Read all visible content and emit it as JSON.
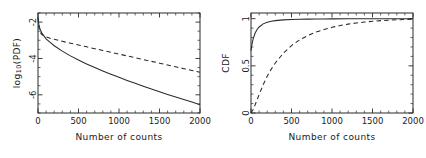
{
  "figure": {
    "panel_count": 2,
    "background_color": "#ffffff",
    "line_color": "#2b2b2b"
  },
  "chart_data": [
    {
      "type": "line",
      "panel": "left",
      "title": "",
      "xlabel": "Number of counts",
      "ylabel": "log10(PDF)",
      "ylabel_display": "log₁₀(PDF)",
      "xlim": [
        0,
        2000
      ],
      "ylim": [
        -7.0,
        -1.5
      ],
      "xticks": [
        0,
        500,
        1000,
        1500,
        2000
      ],
      "xtick_labels": [
        "0",
        "500",
        "1000",
        "1500",
        "2000"
      ],
      "yticks": [
        -2,
        -4,
        -6
      ],
      "ytick_labels": [
        "-2",
        "-4",
        "-6"
      ],
      "minor_ticks": true,
      "grid": false,
      "legend": "none",
      "series": [
        {
          "name": "solid",
          "style": "solid",
          "x": [
            0,
            10,
            25,
            50,
            100,
            150,
            200,
            300,
            400,
            500,
            600,
            700,
            800,
            900,
            1000,
            1100,
            1200,
            1300,
            1400,
            1500,
            1600,
            1700,
            1800,
            1900,
            2000
          ],
          "y": [
            -1.75,
            -2.12,
            -2.38,
            -2.62,
            -2.92,
            -3.12,
            -3.3,
            -3.6,
            -3.86,
            -4.09,
            -4.3,
            -4.5,
            -4.69,
            -4.87,
            -5.04,
            -5.21,
            -5.37,
            -5.53,
            -5.68,
            -5.83,
            -5.98,
            -6.12,
            -6.26,
            -6.4,
            -6.54
          ]
        },
        {
          "name": "dashed",
          "style": "dashed",
          "x": [
            0,
            10,
            25,
            50,
            100,
            150,
            200,
            300,
            400,
            500,
            600,
            700,
            800,
            900,
            1000,
            1100,
            1200,
            1300,
            1400,
            1500,
            1600,
            1700,
            1800,
            1900,
            2000
          ],
          "y": [
            -1.75,
            -2.3,
            -2.55,
            -2.7,
            -2.82,
            -2.89,
            -2.95,
            -3.06,
            -3.16,
            -3.26,
            -3.36,
            -3.46,
            -3.56,
            -3.66,
            -3.76,
            -3.86,
            -3.96,
            -4.06,
            -4.16,
            -4.26,
            -4.36,
            -4.46,
            -4.56,
            -4.66,
            -4.76
          ]
        }
      ]
    },
    {
      "type": "line",
      "panel": "right",
      "title": "",
      "xlabel": "Number of counts",
      "ylabel": "CDF",
      "xlim": [
        0,
        2000
      ],
      "ylim": [
        0.0,
        1.06
      ],
      "xticks": [
        0,
        500,
        1000,
        1500,
        2000
      ],
      "xtick_labels": [
        "0",
        "500",
        "1000",
        "1500",
        "2000"
      ],
      "yticks": [
        0,
        0.5,
        1
      ],
      "ytick_labels": [
        "0",
        "0.5",
        "1"
      ],
      "minor_ticks": true,
      "grid": false,
      "legend": "none",
      "series": [
        {
          "name": "solid",
          "style": "solid",
          "x": [
            0,
            10,
            25,
            50,
            75,
            100,
            150,
            200,
            250,
            300,
            400,
            500,
            600,
            700,
            800,
            900,
            1000,
            1200,
            1400,
            1600,
            1800,
            2000
          ],
          "y": [
            0.66,
            0.72,
            0.78,
            0.845,
            0.885,
            0.912,
            0.945,
            0.962,
            0.972,
            0.979,
            0.987,
            0.991,
            0.9935,
            0.995,
            0.9962,
            0.997,
            0.9977,
            0.9986,
            0.9991,
            0.9995,
            0.9998,
            1.0
          ]
        },
        {
          "name": "dashed",
          "style": "dashed",
          "x": [
            0,
            25,
            50,
            75,
            100,
            150,
            200,
            250,
            300,
            400,
            500,
            600,
            700,
            800,
            900,
            1000,
            1100,
            1200,
            1300,
            1400,
            1500,
            1600,
            1700,
            1800,
            1900,
            2000
          ],
          "y": [
            0.0,
            0.035,
            0.085,
            0.14,
            0.195,
            0.3,
            0.39,
            0.465,
            0.53,
            0.635,
            0.715,
            0.775,
            0.82,
            0.857,
            0.885,
            0.908,
            0.927,
            0.942,
            0.954,
            0.964,
            0.972,
            0.979,
            0.984,
            0.988,
            0.991,
            0.994
          ]
        }
      ]
    }
  ]
}
